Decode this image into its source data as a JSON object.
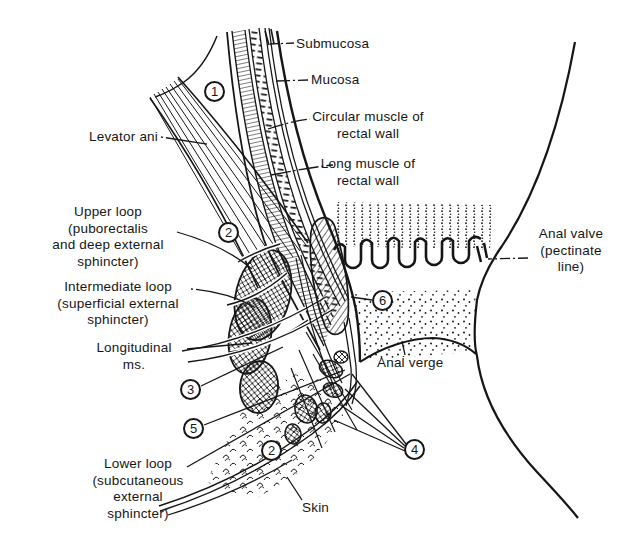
{
  "colors": {
    "background": "#ffffff",
    "ink": "#161616"
  },
  "labels": {
    "submucosa": "Submucosa",
    "mucosa": "Mucosa",
    "circular_muscle": [
      "Circular muscle of",
      "rectal wall"
    ],
    "long_muscle": [
      "Long muscle of",
      "rectal wall"
    ],
    "levator_ani": "Levator ani",
    "upper_loop": [
      "Upper loop",
      "(puborectalis",
      "and deep external",
      "sphincter)"
    ],
    "intermediate_loop": [
      "Intermediate loop",
      "(superficial external",
      "sphincter)"
    ],
    "longitudinal_ms": [
      "Longitudinal",
      "ms."
    ],
    "lower_loop": [
      "Lower loop",
      "(subcutaneous",
      "external",
      "sphincter)"
    ],
    "skin": "Skin",
    "anal_valve": [
      "Anal valve",
      "(pectinate",
      "line)"
    ],
    "anal_verge": "Anal verge"
  },
  "markers": {
    "m1": "1",
    "m2_upper": "2",
    "m3": "3",
    "m5": "5",
    "m2_lower": "2",
    "m4": "4",
    "m6": "6"
  }
}
